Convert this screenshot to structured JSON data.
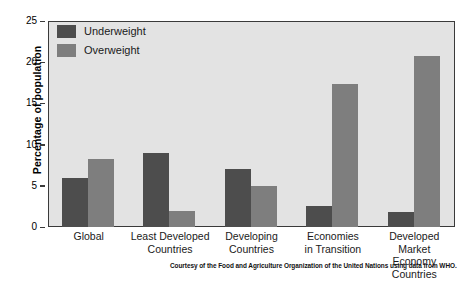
{
  "chart_data": {
    "type": "bar",
    "title": "",
    "xlabel": "",
    "ylabel": "Percentage of population",
    "ylim": [
      0,
      25
    ],
    "yticks": [
      0,
      5,
      10,
      15,
      20,
      25
    ],
    "ytick_labels": [
      "0",
      "5",
      "10",
      "15",
      "20",
      "25"
    ],
    "grid": false,
    "legend_position": "top-left",
    "categories": [
      "Global",
      "Least Developed Countries",
      "Developing Countries",
      "Economies in Transition",
      "Developed Market Economy Countries"
    ],
    "category_lines": [
      [
        "Global"
      ],
      [
        "Least Developed",
        "Countries"
      ],
      [
        "Developing",
        "Countries"
      ],
      [
        "Economies",
        "in Transition"
      ],
      [
        "Developed Market",
        "Economy Countries"
      ]
    ],
    "series": [
      {
        "name": "Underweight",
        "color": "#4d4d4d",
        "values": [
          5.9,
          9.0,
          7.0,
          2.5,
          1.8
        ]
      },
      {
        "name": "Overweight",
        "color": "#7e7e7e",
        "values": [
          8.3,
          2.0,
          5.0,
          17.3,
          20.7
        ]
      }
    ],
    "caption": "Courtesy of the Food and Agriculture Organization of the United Nations using data from WHO.",
    "plot_background": "#e3e3e3",
    "axis_color": "#3a3a3a",
    "page_background": "#ffffff"
  }
}
